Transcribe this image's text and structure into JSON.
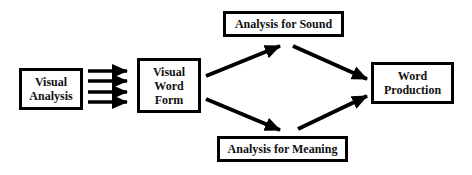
{
  "diagram": {
    "type": "flowchart",
    "nodes": [
      {
        "id": "visual_analysis",
        "label": "Visual\nAnalysis"
      },
      {
        "id": "visual_word_form",
        "label": "Visual\nWord\nForm"
      },
      {
        "id": "analysis_sound",
        "label": "Analysis for Sound"
      },
      {
        "id": "analysis_meaning",
        "label": "Analysis for Meaning"
      },
      {
        "id": "word_production",
        "label": "Word\nProduction"
      }
    ],
    "edges": [
      {
        "from": "visual_analysis",
        "to": "visual_word_form",
        "count": 4
      },
      {
        "from": "visual_word_form",
        "to": "analysis_sound"
      },
      {
        "from": "visual_word_form",
        "to": "analysis_meaning"
      },
      {
        "from": "analysis_sound",
        "to": "word_production"
      },
      {
        "from": "analysis_meaning",
        "to": "word_production"
      }
    ],
    "colors": {
      "stroke": "#000000",
      "background": "#ffffff"
    }
  }
}
